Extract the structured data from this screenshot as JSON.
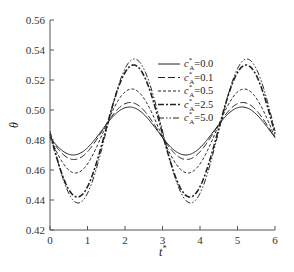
{
  "chart_data": {
    "type": "line",
    "title": "",
    "xlabel": "t*",
    "ylabel": "Θ",
    "xlim": [
      0,
      6
    ],
    "ylim": [
      0.42,
      0.56
    ],
    "xticks": [
      0,
      1,
      2,
      3,
      4,
      5,
      6
    ],
    "xtick_labels": [
      "0",
      "1",
      "2",
      "3",
      "4",
      "5",
      "6"
    ],
    "yticks": [
      0.42,
      0.44,
      0.46,
      0.48,
      0.5,
      0.52,
      0.54,
      0.56
    ],
    "ytick_labels": [
      "0.42",
      "0.44",
      "0.46",
      "0.48",
      "0.50",
      "0.52",
      "0.54",
      "0.56"
    ],
    "grid": false,
    "legend_position": "upper right",
    "x": [
      0,
      0.5,
      1.0,
      1.5,
      2.0,
      2.5,
      3.0,
      3.5,
      4.0,
      4.5,
      5.0,
      5.5,
      6.0
    ],
    "series": [
      {
        "name": "c*A=0.0",
        "dash": "",
        "width": 1.0,
        "values": [
          0.484,
          0.471,
          0.473,
          0.488,
          0.501,
          0.499,
          0.484,
          0.471,
          0.473,
          0.488,
          0.501,
          0.499,
          0.484
        ]
      },
      {
        "name": "c*A=0.1",
        "dash": "7,3",
        "width": 1.0,
        "values": [
          0.484,
          0.469,
          0.471,
          0.488,
          0.503,
          0.501,
          0.484,
          0.469,
          0.471,
          0.488,
          0.503,
          0.501,
          0.484
        ]
      },
      {
        "name": "c*A=0.5",
        "dash": "3,2",
        "width": 1.0,
        "values": [
          0.483,
          0.46,
          0.463,
          0.489,
          0.512,
          0.509,
          0.483,
          0.46,
          0.463,
          0.489,
          0.512,
          0.509,
          0.483
        ]
      },
      {
        "name": "c*A=2.5",
        "dash": "6,2,2,2",
        "width": 1.6,
        "values": [
          0.481,
          0.446,
          0.45,
          0.491,
          0.526,
          0.522,
          0.481,
          0.446,
          0.45,
          0.491,
          0.526,
          0.522,
          0.481
        ]
      },
      {
        "name": "c*A=5.0",
        "dash": "6,2,1.5,2,1.5,2",
        "width": 1.0,
        "values": [
          0.481,
          0.442,
          0.447,
          0.491,
          0.53,
          0.525,
          0.481,
          0.442,
          0.447,
          0.491,
          0.53,
          0.525,
          0.481
        ]
      }
    ],
    "params": {
      "period": 3.0,
      "phase": 1.45,
      "mean": 0.486,
      "amplitudes": [
        0.016,
        0.019,
        0.028,
        0.044,
        0.048
      ]
    }
  },
  "legend": {
    "entries": [
      {
        "prefix": "c",
        "sup": "*",
        "sub": "A",
        "value": "=0.0"
      },
      {
        "prefix": "c",
        "sup": "*",
        "sub": "A",
        "value": "=0.1"
      },
      {
        "prefix": "c",
        "sup": "*",
        "sub": "A",
        "value": "=0.5"
      },
      {
        "prefix": "c",
        "sup": "*",
        "sub": "A",
        "value": "=2.5"
      },
      {
        "prefix": "c",
        "sup": "*",
        "sub": "A",
        "value": "=5.0"
      }
    ]
  },
  "axes": {
    "x_label_main": "t",
    "x_label_sup": "*",
    "y_label": "θ"
  }
}
